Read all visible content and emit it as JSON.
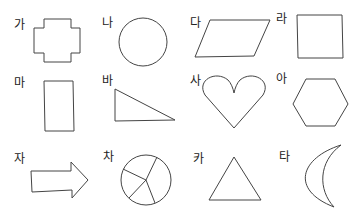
{
  "items": [
    {
      "label": "가",
      "shape": "plus-cross-octagon"
    },
    {
      "label": "나",
      "shape": "circle"
    },
    {
      "label": "다",
      "shape": "parallelogram"
    },
    {
      "label": "라",
      "shape": "square"
    },
    {
      "label": "마",
      "shape": "rectangle"
    },
    {
      "label": "바",
      "shape": "right-triangle"
    },
    {
      "label": "사",
      "shape": "heart"
    },
    {
      "label": "아",
      "shape": "hexagon"
    },
    {
      "label": "자",
      "shape": "arrow"
    },
    {
      "label": "차",
      "shape": "circle-divided-into-5-sectors"
    },
    {
      "label": "카",
      "shape": "triangle"
    },
    {
      "label": "타",
      "shape": "crescent"
    }
  ],
  "colors": {
    "stroke": "#444444",
    "background": "#ffffff"
  }
}
